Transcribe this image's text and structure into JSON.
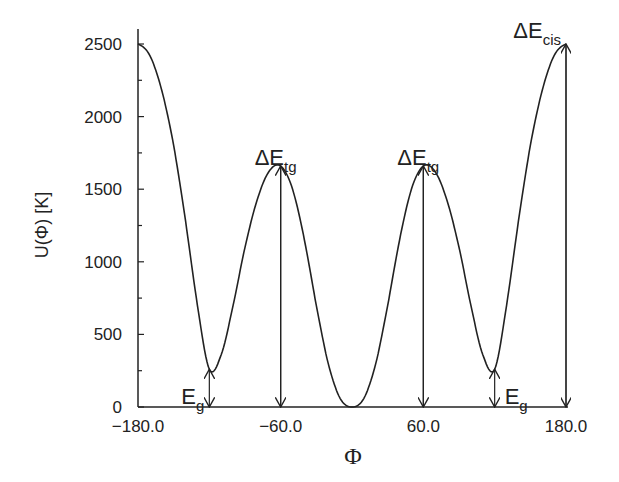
{
  "chart_data": {
    "type": "line",
    "title": "",
    "xlabel": "Φ",
    "ylabel": "U(Φ) [K]",
    "xlim": [
      -180,
      180
    ],
    "ylim": [
      0,
      2500
    ],
    "grid": false,
    "legend": null,
    "x_ticks": [
      "-180.0",
      "-60.0",
      "60.0",
      "180.0"
    ],
    "x_tick_values": [
      -180,
      -60,
      60,
      180
    ],
    "y_ticks": [
      "0",
      "500",
      "1000",
      "1500",
      "2000",
      "2500"
    ],
    "y_tick_values": [
      0,
      500,
      1000,
      1500,
      2000,
      2500
    ],
    "series": [
      {
        "name": "U(Φ)",
        "x": [
          -180,
          -170,
          -160,
          -150,
          -140,
          -130,
          -120,
          -110,
          -100,
          -90,
          -80,
          -70,
          -60,
          -50,
          -40,
          -30,
          -20,
          -10,
          0,
          10,
          20,
          30,
          40,
          50,
          60,
          70,
          80,
          90,
          100,
          110,
          120,
          130,
          140,
          150,
          160,
          170,
          180
        ],
        "values": [
          2500,
          2420,
          2180,
          1800,
          1280,
          700,
          260,
          360,
          700,
          1100,
          1420,
          1620,
          1660,
          1500,
          1150,
          700,
          300,
          60,
          0,
          60,
          300,
          700,
          1150,
          1500,
          1660,
          1620,
          1420,
          1100,
          700,
          360,
          260,
          700,
          1280,
          1800,
          2180,
          2420,
          2500
        ]
      }
    ],
    "annotations": [
      {
        "label": "E",
        "sub": "g",
        "x": -120,
        "from": 0,
        "to": 260
      },
      {
        "label": "ΔE",
        "sub": "tg",
        "x": -60,
        "from": 0,
        "to": 1660
      },
      {
        "label": "ΔE",
        "sub": "tg",
        "x": 60,
        "from": 0,
        "to": 1660
      },
      {
        "label": "E",
        "sub": "g",
        "x": 120,
        "from": 0,
        "to": 260
      },
      {
        "label": "ΔE",
        "sub": "cis",
        "x": 180,
        "from": 0,
        "to": 2500
      }
    ]
  }
}
